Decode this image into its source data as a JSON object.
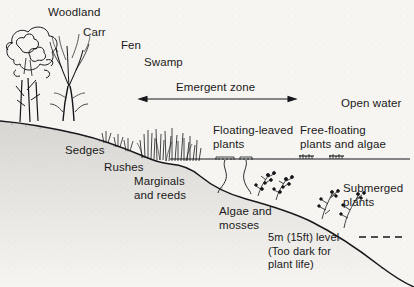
{
  "figure": {
    "background_color": "#f7f5f1",
    "ink_color": "#1a1a1a",
    "water_line_y": 159,
    "width": 414,
    "height": 287
  },
  "labels": {
    "woodland": "Woodland",
    "carr": "Carr",
    "fen": "Fen",
    "swamp": "Swamp",
    "emergent_zone": "Emergent zone",
    "open_water": "Open water",
    "sedges": "Sedges",
    "rushes": "Rushes",
    "marginals_and_reeds": "Marginals\nand reeds",
    "floating_leaved_plants": "Floating-leaved\nplants",
    "free_floating_plants": "Free-floating\nplants and algae",
    "algae_and_mosses": "Algae and\nmosses",
    "submerged_plants": "Submerged\nplants",
    "depth_level": "5m (15ft) level",
    "depth_note": "(Too dark for\nplant life)"
  },
  "annotations": {
    "emergent_zone_arrow": {
      "style": "double-headed",
      "x_start": 139,
      "x_end": 296,
      "y": 99
    },
    "depth_dashed_line": {
      "style": "dashed",
      "x_start": 359,
      "x_end": 406,
      "y": 237
    }
  },
  "zones": [
    {
      "name": "Woodland",
      "position": "far-left bank"
    },
    {
      "name": "Carr",
      "position": "left bank"
    },
    {
      "name": "Fen",
      "position": "upper bank"
    },
    {
      "name": "Swamp",
      "position": "bank edge"
    },
    {
      "name": "Emergent zone",
      "position": "shallow margin"
    },
    {
      "name": "Open water",
      "position": "right deep water"
    }
  ],
  "plant_groups": [
    {
      "name": "Sedges",
      "habitat": "bank"
    },
    {
      "name": "Rushes",
      "habitat": "bank edge"
    },
    {
      "name": "Marginals and reeds",
      "habitat": "shallow water margin"
    },
    {
      "name": "Floating-leaved plants",
      "habitat": "shallow open water"
    },
    {
      "name": "Free-floating plants and algae",
      "habitat": "water surface"
    },
    {
      "name": "Algae and mosses",
      "habitat": "lake bed shallow"
    },
    {
      "name": "Submerged plants",
      "habitat": "deeper lake bed"
    }
  ]
}
